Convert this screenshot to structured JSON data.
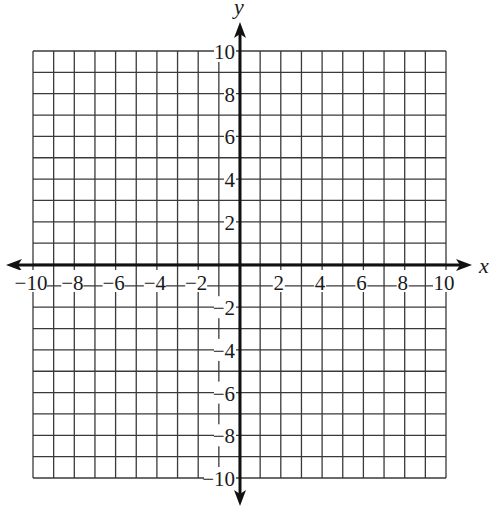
{
  "chart_data": {
    "type": "coordinate-grid",
    "title": "",
    "xlabel": "x",
    "ylabel": "y",
    "xlim": [
      -10,
      10
    ],
    "ylim": [
      -10,
      10
    ],
    "grid": true,
    "grid_step": 1,
    "x_ticks": [
      -10,
      -8,
      -6,
      -4,
      -2,
      2,
      4,
      6,
      8,
      10
    ],
    "y_ticks": [
      10,
      8,
      6,
      4,
      2,
      -2,
      -4,
      -6,
      -8,
      -10
    ],
    "x_tick_labels": [
      "−10",
      "−8",
      "−6",
      "−4",
      "−2",
      "2",
      "4",
      "6",
      "8",
      "10"
    ],
    "y_tick_labels": [
      "10",
      "8",
      "6",
      "4",
      "2",
      "−2",
      "−4",
      "−6",
      "−8",
      "−10"
    ],
    "axes_arrows": true,
    "data_points": []
  },
  "colors": {
    "grid": "#3a3a3a",
    "axis": "#111111",
    "background": "#ffffff"
  },
  "layout": {
    "grid_left": 33,
    "grid_right": 446,
    "grid_top": 51,
    "grid_bottom": 478,
    "origin_x": 240,
    "origin_y": 265,
    "x_axis_start": 6,
    "x_axis_end": 472,
    "y_axis_start": 22,
    "y_axis_end": 506
  }
}
